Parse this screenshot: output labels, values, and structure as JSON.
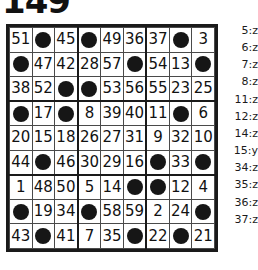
{
  "title": "149",
  "grid": {
    "rows": 9,
    "cols": 9,
    "cells": [
      [
        {
          "t": "num",
          "v": "51",
          "s": false
        },
        {
          "t": "dot",
          "v": "",
          "s": false
        },
        {
          "t": "num",
          "v": "45",
          "s": false
        },
        {
          "t": "dot",
          "v": "",
          "s": false
        },
        {
          "t": "num",
          "v": "49",
          "s": false
        },
        {
          "t": "num",
          "v": "36",
          "s": false
        },
        {
          "t": "num",
          "v": "37",
          "s": false
        },
        {
          "t": "dot",
          "v": "",
          "s": false
        },
        {
          "t": "num",
          "v": "3",
          "s": true
        }
      ],
      [
        {
          "t": "dot",
          "v": "",
          "s": false
        },
        {
          "t": "num",
          "v": "47",
          "s": false
        },
        {
          "t": "num",
          "v": "42",
          "s": false
        },
        {
          "t": "num",
          "v": "28",
          "s": false
        },
        {
          "t": "num",
          "v": "57",
          "s": false
        },
        {
          "t": "dot",
          "v": "",
          "s": false
        },
        {
          "t": "num",
          "v": "54",
          "s": false
        },
        {
          "t": "num",
          "v": "13",
          "s": true
        },
        {
          "t": "dot",
          "v": "",
          "s": false
        }
      ],
      [
        {
          "t": "num",
          "v": "38",
          "s": false
        },
        {
          "t": "num",
          "v": "52",
          "s": false
        },
        {
          "t": "dot",
          "v": "",
          "s": false
        },
        {
          "t": "dot",
          "v": "",
          "s": false
        },
        {
          "t": "num",
          "v": "53",
          "s": false
        },
        {
          "t": "num",
          "v": "56",
          "s": false
        },
        {
          "t": "num",
          "v": "55",
          "s": false
        },
        {
          "t": "num",
          "v": "23",
          "s": false
        },
        {
          "t": "num",
          "v": "25",
          "s": false
        }
      ],
      [
        {
          "t": "dot",
          "v": "",
          "s": false
        },
        {
          "t": "num",
          "v": "17",
          "s": false
        },
        {
          "t": "dot",
          "v": "",
          "s": false
        },
        {
          "t": "num",
          "v": "8",
          "s": true
        },
        {
          "t": "num",
          "v": "39",
          "s": false
        },
        {
          "t": "num",
          "v": "40",
          "s": false
        },
        {
          "t": "num",
          "v": "11",
          "s": true
        },
        {
          "t": "dot",
          "v": "",
          "s": false
        },
        {
          "t": "num",
          "v": "6",
          "s": true
        }
      ],
      [
        {
          "t": "num",
          "v": "20",
          "s": false
        },
        {
          "t": "num",
          "v": "15",
          "s": true
        },
        {
          "t": "num",
          "v": "18",
          "s": false
        },
        {
          "t": "num",
          "v": "26",
          "s": false
        },
        {
          "t": "num",
          "v": "27",
          "s": false
        },
        {
          "t": "num",
          "v": "31",
          "s": false
        },
        {
          "t": "num",
          "v": "9",
          "s": true
        },
        {
          "t": "num",
          "v": "32",
          "s": false
        },
        {
          "t": "num",
          "v": "10",
          "s": true
        }
      ],
      [
        {
          "t": "num",
          "v": "44",
          "s": false
        },
        {
          "t": "dot",
          "v": "",
          "s": false
        },
        {
          "t": "num",
          "v": "46",
          "s": false
        },
        {
          "t": "num",
          "v": "30",
          "s": false
        },
        {
          "t": "num",
          "v": "29",
          "s": false
        },
        {
          "t": "num",
          "v": "16",
          "s": false
        },
        {
          "t": "dot",
          "v": "",
          "s": false
        },
        {
          "t": "num",
          "v": "33",
          "s": false
        },
        {
          "t": "dot",
          "v": "",
          "s": false
        }
      ],
      [
        {
          "t": "num",
          "v": "1",
          "s": true
        },
        {
          "t": "num",
          "v": "48",
          "s": false
        },
        {
          "t": "num",
          "v": "50",
          "s": false
        },
        {
          "t": "num",
          "v": "5",
          "s": true
        },
        {
          "t": "num",
          "v": "14",
          "s": true
        },
        {
          "t": "dot",
          "v": "",
          "s": false
        },
        {
          "t": "dot",
          "v": "",
          "s": true
        },
        {
          "t": "num",
          "v": "12",
          "s": true
        },
        {
          "t": "num",
          "v": "4",
          "s": true
        }
      ],
      [
        {
          "t": "dot",
          "v": "",
          "s": false
        },
        {
          "t": "num",
          "v": "19",
          "s": false
        },
        {
          "t": "num",
          "v": "34",
          "s": false
        },
        {
          "t": "dot",
          "v": "",
          "s": false
        },
        {
          "t": "num",
          "v": "58",
          "s": false
        },
        {
          "t": "num",
          "v": "59",
          "s": false
        },
        {
          "t": "num",
          "v": "2",
          "s": true
        },
        {
          "t": "num",
          "v": "24",
          "s": false
        },
        {
          "t": "dot",
          "v": "",
          "s": false
        }
      ],
      [
        {
          "t": "num",
          "v": "43",
          "s": false
        },
        {
          "t": "dot",
          "v": "",
          "s": false
        },
        {
          "t": "num",
          "v": "41",
          "s": false
        },
        {
          "t": "num",
          "v": "7",
          "s": true
        },
        {
          "t": "num",
          "v": "35",
          "s": false
        },
        {
          "t": "dot",
          "v": "",
          "s": false
        },
        {
          "t": "num",
          "v": "22",
          "s": false
        },
        {
          "t": "dot",
          "v": "",
          "s": false
        },
        {
          "t": "num",
          "v": "21",
          "s": false
        }
      ]
    ]
  },
  "legend": {
    "entries": [
      "5:z",
      "6:z",
      "7:z",
      "8:z",
      "11:z",
      "12:z",
      "14:z",
      "15:y",
      "34:z",
      "35:z",
      "36:z",
      "37:z"
    ]
  },
  "colors": {
    "shaded_cell": "#c0c0c0",
    "dot": "#161616",
    "grid_line": "#4a4a4a",
    "grid_border": "#1a1a1a",
    "text": "#121212"
  }
}
